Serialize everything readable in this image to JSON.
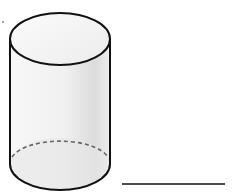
{
  "figure": {
    "shape": "cylinder",
    "hidden_edge_style": "dashed",
    "answer_line": true
  },
  "colors": {
    "stroke": "#111111",
    "dashed": "#666666",
    "fill_light": "#f4f4f4",
    "fill_shade": "#d9d9d9"
  }
}
